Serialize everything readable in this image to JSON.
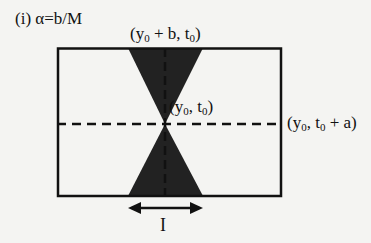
{
  "figure": {
    "title": "(i) α=b/M",
    "labels": {
      "top": {
        "prefix": "(y",
        "sub": "0",
        "suffix": " + b, t",
        "sub2": "0",
        "end": ")"
      },
      "center": {
        "prefix": "(y",
        "sub": "0",
        "suffix": ", t",
        "sub2": "0",
        "end": ")"
      },
      "right": {
        "prefix": "(y",
        "sub": "0",
        "suffix": ", t",
        "sub2": "0",
        "end": " + a)"
      },
      "interval": "I"
    },
    "colors": {
      "stroke": "#111111",
      "fill": "#222222",
      "background": "#f4f4f2"
    },
    "geometry": {
      "rect": {
        "x": 57,
        "y": 48,
        "width": 224,
        "height": 148
      },
      "center": {
        "x": 165,
        "y": 124
      },
      "top_triangle_base": {
        "x1": 128,
        "x2": 203,
        "y": 48
      },
      "bottom_triangle_base": {
        "x1": 128,
        "x2": 203,
        "y": 196
      },
      "arrow": {
        "x1": 128,
        "x2": 202,
        "y": 208
      }
    }
  }
}
